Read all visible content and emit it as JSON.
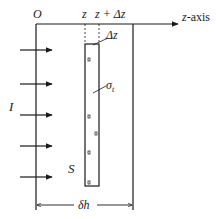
{
  "diagram": {
    "origin_label": "O",
    "axis_label_var": "z",
    "axis_label_suffix": "-axis",
    "z_label": "z",
    "z_plus_dz_label": "z + Δz",
    "delta_z_label": "Δz",
    "sigma_label": "σ",
    "sigma_subscript": "t",
    "incident_label": "I",
    "surface_label": "S",
    "width_label": "δh",
    "arrow_count": 5,
    "colors": {
      "line": "#1a1a1a",
      "background": "#ffffff"
    }
  }
}
